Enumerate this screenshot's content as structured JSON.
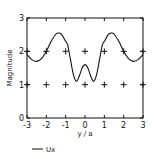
{
  "chart_data": {
    "type": "line",
    "title": "",
    "xlabel": "y / a",
    "ylabel": "Magnitude",
    "xlim": [
      -3,
      3
    ],
    "ylim": [
      0,
      3
    ],
    "xticks": [
      "-3",
      "-2",
      "-1",
      "0",
      "1",
      "2",
      "3"
    ],
    "yticks": [
      "0",
      "1",
      "2",
      "3"
    ],
    "grid": "plus-markers at integer points",
    "legend": {
      "position": "bottom-left",
      "entries": [
        "Ux"
      ]
    },
    "series": [
      {
        "name": "Ux",
        "x": [
          -3.0,
          -2.75,
          -2.5,
          -2.25,
          -2.0,
          -1.75,
          -1.5,
          -1.35,
          -1.2,
          -1.0,
          -0.9,
          -0.75,
          -0.6,
          -0.45,
          -0.3,
          -0.15,
          0.0,
          0.15,
          0.3,
          0.45,
          0.6,
          0.75,
          0.9,
          1.0,
          1.2,
          1.35,
          1.5,
          1.75,
          2.0,
          2.25,
          2.5,
          2.75,
          3.0
        ],
        "y": [
          1.9,
          1.75,
          1.7,
          1.78,
          2.0,
          2.3,
          2.52,
          2.55,
          2.5,
          2.3,
          2.2,
          1.75,
          1.3,
          1.1,
          1.25,
          1.5,
          1.6,
          1.5,
          1.25,
          1.1,
          1.3,
          1.75,
          2.2,
          2.3,
          2.5,
          2.55,
          2.52,
          2.3,
          2.0,
          1.78,
          1.7,
          1.75,
          1.9
        ]
      }
    ]
  },
  "legend": {
    "label": "Ux"
  }
}
